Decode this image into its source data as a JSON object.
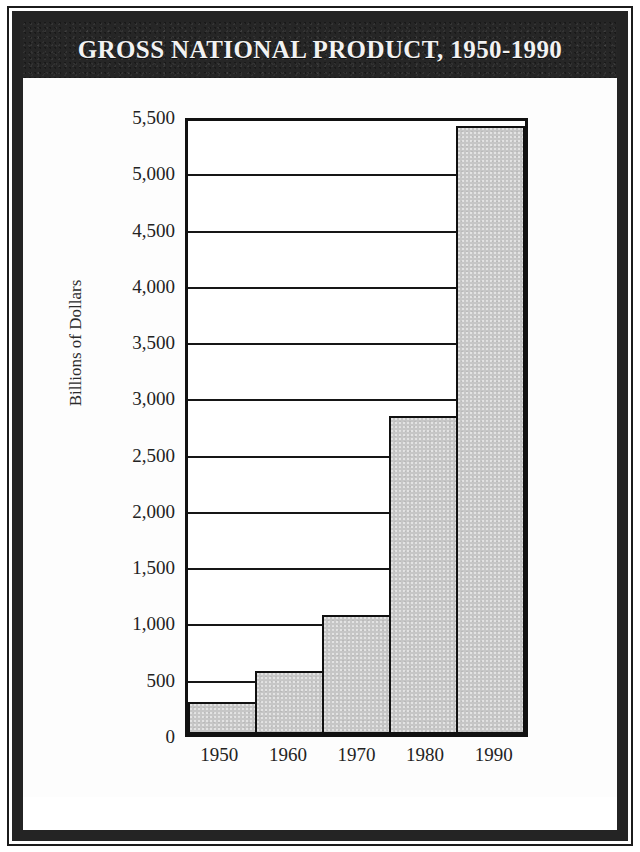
{
  "poster": {
    "title": "GROSS NATIONAL PRODUCT, 1950-1990",
    "frame_color": "#242424",
    "title_band_color": "#262626",
    "title_text_color": "#f2f2f2",
    "background": "#ffffff"
  },
  "chart_data": {
    "type": "bar",
    "title": "GROSS NATIONAL PRODUCT, 1950-1990",
    "subtitle": "",
    "categories": [
      "1950",
      "1960",
      "1970",
      "1980",
      "1990"
    ],
    "values": [
      285,
      560,
      1060,
      2830,
      5400
    ],
    "series": [
      {
        "name": "Gross National Product",
        "values": [
          285,
          560,
          1060,
          2830,
          5400
        ]
      }
    ],
    "xlabel": "",
    "ylabel": "Billions of Dollars",
    "ylim": [
      0,
      5500
    ],
    "ytick_values": [
      0,
      500,
      1000,
      1500,
      2000,
      2500,
      3000,
      3500,
      4000,
      4500,
      5000,
      5500
    ],
    "ytick_labels": [
      "0",
      "500",
      "1,000",
      "1,500",
      "2,000",
      "2,500",
      "3,000",
      "3,500",
      "4,000",
      "4,500",
      "5,000",
      "5,500"
    ],
    "grid": true,
    "grid_axis": "y",
    "legend": false,
    "legend_position": "none",
    "bar_fill_color": "#c6c6c6",
    "bar_edge_color": "#111111",
    "bar_gap": 0,
    "plot_border_color": "#111111",
    "units": "Billions of Dollars"
  }
}
